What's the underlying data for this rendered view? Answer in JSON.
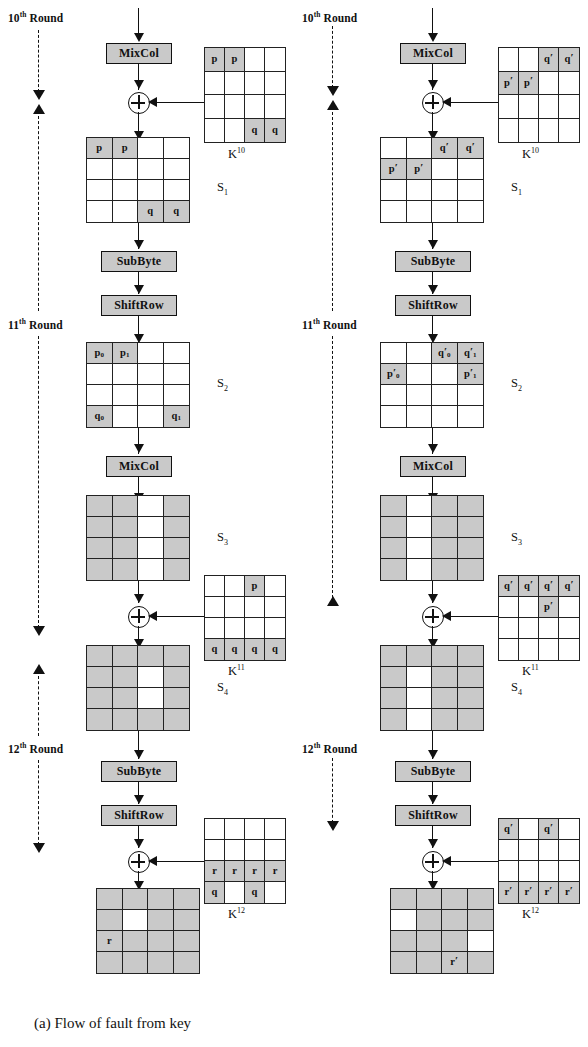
{
  "figure": {
    "caption_a": "(a) Flow of fault from key",
    "caption_b": "(b)  Flow  of  fault  from",
    "shade_color": "#c9c9c9",
    "line_color": "#111111"
  },
  "rounds": {
    "r10": "10",
    "r11": "11",
    "r12": "12",
    "ordinal": "th",
    "word": " Round"
  },
  "ops": {
    "mixcol": "MixCol",
    "subbyte": "SubByte",
    "shiftrow": "ShiftRow"
  },
  "labels": {
    "k10": "K",
    "k10_sup": "10",
    "k11": "K",
    "k11_sup": "11",
    "k12": "K",
    "k12_sup": "12",
    "s1": "S",
    "s1_sub": "1",
    "s2": "S",
    "s2_sub": "2",
    "s3": "S",
    "s3_sub": "3",
    "s4": "S",
    "s4_sub": "4"
  },
  "left": {
    "k10": {
      "name": "K10",
      "cells": [
        {
          "t": "p",
          "sh": true
        },
        {
          "t": "p",
          "sh": true
        },
        {
          "t": "",
          "sh": false
        },
        {
          "t": "",
          "sh": false
        },
        {
          "t": "",
          "sh": false
        },
        {
          "t": "",
          "sh": false
        },
        {
          "t": "",
          "sh": false
        },
        {
          "t": "",
          "sh": false
        },
        {
          "t": "",
          "sh": false
        },
        {
          "t": "",
          "sh": false
        },
        {
          "t": "",
          "sh": false
        },
        {
          "t": "",
          "sh": false
        },
        {
          "t": "",
          "sh": false
        },
        {
          "t": "",
          "sh": false
        },
        {
          "t": "q",
          "sh": true
        },
        {
          "t": "q",
          "sh": true
        }
      ]
    },
    "s1": {
      "name": "S1",
      "cells": [
        {
          "t": "p",
          "sh": true
        },
        {
          "t": "p",
          "sh": true
        },
        {
          "t": "",
          "sh": false
        },
        {
          "t": "",
          "sh": false
        },
        {
          "t": "",
          "sh": false
        },
        {
          "t": "",
          "sh": false
        },
        {
          "t": "",
          "sh": false
        },
        {
          "t": "",
          "sh": false
        },
        {
          "t": "",
          "sh": false
        },
        {
          "t": "",
          "sh": false
        },
        {
          "t": "",
          "sh": false
        },
        {
          "t": "",
          "sh": false
        },
        {
          "t": "",
          "sh": false
        },
        {
          "t": "",
          "sh": false
        },
        {
          "t": "q",
          "sh": true
        },
        {
          "t": "q",
          "sh": true
        }
      ]
    },
    "s2": {
      "name": "S2",
      "cells": [
        {
          "t": "p",
          "sub": "0",
          "sh": true
        },
        {
          "t": "p",
          "sub": "1",
          "sh": true
        },
        {
          "t": "",
          "sh": false
        },
        {
          "t": "",
          "sh": false
        },
        {
          "t": "",
          "sh": false
        },
        {
          "t": "",
          "sh": false
        },
        {
          "t": "",
          "sh": false
        },
        {
          "t": "",
          "sh": false
        },
        {
          "t": "",
          "sh": false
        },
        {
          "t": "",
          "sh": false
        },
        {
          "t": "",
          "sh": false
        },
        {
          "t": "",
          "sh": false
        },
        {
          "t": "q",
          "sub": "0",
          "sh": true
        },
        {
          "t": "",
          "sh": false
        },
        {
          "t": "",
          "sh": false
        },
        {
          "t": "q",
          "sub": "1",
          "sh": true
        }
      ]
    },
    "s3": {
      "name": "S3",
      "cells": [
        {
          "t": "",
          "sh": true
        },
        {
          "t": "",
          "sh": true
        },
        {
          "t": "",
          "sh": false
        },
        {
          "t": "",
          "sh": true
        },
        {
          "t": "",
          "sh": true
        },
        {
          "t": "",
          "sh": true
        },
        {
          "t": "",
          "sh": false
        },
        {
          "t": "",
          "sh": true
        },
        {
          "t": "",
          "sh": true
        },
        {
          "t": "",
          "sh": true
        },
        {
          "t": "",
          "sh": false
        },
        {
          "t": "",
          "sh": true
        },
        {
          "t": "",
          "sh": true
        },
        {
          "t": "",
          "sh": true
        },
        {
          "t": "",
          "sh": false
        },
        {
          "t": "",
          "sh": true
        }
      ]
    },
    "k11": {
      "name": "K11",
      "cells": [
        {
          "t": "",
          "sh": false
        },
        {
          "t": "",
          "sh": false
        },
        {
          "t": "p",
          "sh": true
        },
        {
          "t": "",
          "sh": false
        },
        {
          "t": "",
          "sh": false
        },
        {
          "t": "",
          "sh": false
        },
        {
          "t": "",
          "sh": false
        },
        {
          "t": "",
          "sh": false
        },
        {
          "t": "",
          "sh": false
        },
        {
          "t": "",
          "sh": false
        },
        {
          "t": "",
          "sh": false
        },
        {
          "t": "",
          "sh": false
        },
        {
          "t": "q",
          "sh": true
        },
        {
          "t": "q",
          "sh": true
        },
        {
          "t": "q",
          "sh": true
        },
        {
          "t": "q",
          "sh": true
        }
      ]
    },
    "s4": {
      "name": "S4",
      "cells": [
        {
          "t": "",
          "sh": true
        },
        {
          "t": "",
          "sh": true
        },
        {
          "t": "",
          "sh": true
        },
        {
          "t": "",
          "sh": true
        },
        {
          "t": "",
          "sh": true
        },
        {
          "t": "",
          "sh": true
        },
        {
          "t": "",
          "sh": false
        },
        {
          "t": "",
          "sh": true
        },
        {
          "t": "",
          "sh": true
        },
        {
          "t": "",
          "sh": true
        },
        {
          "t": "",
          "sh": false
        },
        {
          "t": "",
          "sh": true
        },
        {
          "t": "",
          "sh": true
        },
        {
          "t": "",
          "sh": true
        },
        {
          "t": "",
          "sh": true
        },
        {
          "t": "",
          "sh": true
        }
      ]
    },
    "k12": {
      "name": "K12",
      "cells": [
        {
          "t": "",
          "sh": false
        },
        {
          "t": "",
          "sh": false
        },
        {
          "t": "",
          "sh": false
        },
        {
          "t": "",
          "sh": false
        },
        {
          "t": "",
          "sh": false
        },
        {
          "t": "",
          "sh": false
        },
        {
          "t": "",
          "sh": false
        },
        {
          "t": "",
          "sh": false
        },
        {
          "t": "r",
          "sh": true
        },
        {
          "t": "r",
          "sh": true
        },
        {
          "t": "r",
          "sh": true
        },
        {
          "t": "r",
          "sh": true
        },
        {
          "t": "q",
          "sh": true
        },
        {
          "t": "",
          "sh": false
        },
        {
          "t": "q",
          "sh": true
        },
        {
          "t": "",
          "sh": false
        }
      ]
    },
    "final": {
      "name": "final-state",
      "cells": [
        {
          "t": "",
          "sh": true
        },
        {
          "t": "",
          "sh": true
        },
        {
          "t": "",
          "sh": true
        },
        {
          "t": "",
          "sh": true
        },
        {
          "t": "",
          "sh": true
        },
        {
          "t": "",
          "sh": false
        },
        {
          "t": "",
          "sh": true
        },
        {
          "t": "",
          "sh": true
        },
        {
          "t": "r",
          "sh": true
        },
        {
          "t": "",
          "sh": true
        },
        {
          "t": "",
          "sh": true
        },
        {
          "t": "",
          "sh": true
        },
        {
          "t": "",
          "sh": true
        },
        {
          "t": "",
          "sh": true
        },
        {
          "t": "",
          "sh": true
        },
        {
          "t": "",
          "sh": true
        }
      ]
    }
  },
  "right": {
    "k10": {
      "name": "K10",
      "cells": [
        {
          "t": "",
          "sh": false
        },
        {
          "t": "",
          "sh": false
        },
        {
          "t": "q",
          "pr": true,
          "sh": true
        },
        {
          "t": "q",
          "pr": true,
          "sh": true
        },
        {
          "t": "p",
          "pr": true,
          "sh": true
        },
        {
          "t": "p",
          "pr": true,
          "sh": true
        },
        {
          "t": "",
          "sh": false
        },
        {
          "t": "",
          "sh": false
        },
        {
          "t": "",
          "sh": false
        },
        {
          "t": "",
          "sh": false
        },
        {
          "t": "",
          "sh": false
        },
        {
          "t": "",
          "sh": false
        },
        {
          "t": "",
          "sh": false
        },
        {
          "t": "",
          "sh": false
        },
        {
          "t": "",
          "sh": false
        },
        {
          "t": "",
          "sh": false
        }
      ]
    },
    "s1": {
      "name": "S1",
      "cells": [
        {
          "t": "",
          "sh": false
        },
        {
          "t": "",
          "sh": false
        },
        {
          "t": "q",
          "pr": true,
          "sh": true
        },
        {
          "t": "q",
          "pr": true,
          "sh": true
        },
        {
          "t": "p",
          "pr": true,
          "sh": true
        },
        {
          "t": "p",
          "pr": true,
          "sh": true
        },
        {
          "t": "",
          "sh": false
        },
        {
          "t": "",
          "sh": false
        },
        {
          "t": "",
          "sh": false
        },
        {
          "t": "",
          "sh": false
        },
        {
          "t": "",
          "sh": false
        },
        {
          "t": "",
          "sh": false
        },
        {
          "t": "",
          "sh": false
        },
        {
          "t": "",
          "sh": false
        },
        {
          "t": "",
          "sh": false
        },
        {
          "t": "",
          "sh": false
        }
      ]
    },
    "s2": {
      "name": "S2",
      "cells": [
        {
          "t": "",
          "sh": false
        },
        {
          "t": "",
          "sh": false
        },
        {
          "t": "q",
          "pr": true,
          "sub": "0",
          "sh": true
        },
        {
          "t": "q",
          "pr": true,
          "sub": "1",
          "sh": true
        },
        {
          "t": "p",
          "pr": true,
          "sub": "0",
          "sh": true
        },
        {
          "t": "",
          "sh": false
        },
        {
          "t": "",
          "sh": false
        },
        {
          "t": "p",
          "pr": true,
          "sub": "1",
          "sh": true
        },
        {
          "t": "",
          "sh": false
        },
        {
          "t": "",
          "sh": false
        },
        {
          "t": "",
          "sh": false
        },
        {
          "t": "",
          "sh": false
        },
        {
          "t": "",
          "sh": false
        },
        {
          "t": "",
          "sh": false
        },
        {
          "t": "",
          "sh": false
        },
        {
          "t": "",
          "sh": false
        }
      ]
    },
    "s3": {
      "name": "S3",
      "cells": [
        {
          "t": "",
          "sh": true
        },
        {
          "t": "",
          "sh": false
        },
        {
          "t": "",
          "sh": true
        },
        {
          "t": "",
          "sh": true
        },
        {
          "t": "",
          "sh": true
        },
        {
          "t": "",
          "sh": false
        },
        {
          "t": "",
          "sh": true
        },
        {
          "t": "",
          "sh": true
        },
        {
          "t": "",
          "sh": true
        },
        {
          "t": "",
          "sh": false
        },
        {
          "t": "",
          "sh": true
        },
        {
          "t": "",
          "sh": true
        },
        {
          "t": "",
          "sh": true
        },
        {
          "t": "",
          "sh": false
        },
        {
          "t": "",
          "sh": true
        },
        {
          "t": "",
          "sh": true
        }
      ]
    },
    "k11": {
      "name": "K11",
      "cells": [
        {
          "t": "q",
          "pr": true,
          "sh": true
        },
        {
          "t": "q",
          "pr": true,
          "sh": true
        },
        {
          "t": "q",
          "pr": true,
          "sh": true
        },
        {
          "t": "q",
          "pr": true,
          "sh": true
        },
        {
          "t": "",
          "sh": false
        },
        {
          "t": "",
          "sh": false
        },
        {
          "t": "p",
          "pr": true,
          "sh": true
        },
        {
          "t": "",
          "sh": false
        },
        {
          "t": "",
          "sh": false
        },
        {
          "t": "",
          "sh": false
        },
        {
          "t": "",
          "sh": false
        },
        {
          "t": "",
          "sh": false
        },
        {
          "t": "",
          "sh": false
        },
        {
          "t": "",
          "sh": false
        },
        {
          "t": "",
          "sh": false
        },
        {
          "t": "",
          "sh": false
        }
      ]
    },
    "s4": {
      "name": "S4",
      "cells": [
        {
          "t": "",
          "sh": true
        },
        {
          "t": "",
          "sh": true
        },
        {
          "t": "",
          "sh": true
        },
        {
          "t": "",
          "sh": true
        },
        {
          "t": "",
          "sh": true
        },
        {
          "t": "",
          "sh": false
        },
        {
          "t": "",
          "sh": true
        },
        {
          "t": "",
          "sh": true
        },
        {
          "t": "",
          "sh": true
        },
        {
          "t": "",
          "sh": false
        },
        {
          "t": "",
          "sh": true
        },
        {
          "t": "",
          "sh": true
        },
        {
          "t": "",
          "sh": true
        },
        {
          "t": "",
          "sh": false
        },
        {
          "t": "",
          "sh": true
        },
        {
          "t": "",
          "sh": true
        }
      ]
    },
    "k12": {
      "name": "K12",
      "cells": [
        {
          "t": "q",
          "pr": true,
          "sh": true
        },
        {
          "t": "",
          "sh": false
        },
        {
          "t": "q",
          "pr": true,
          "sh": true
        },
        {
          "t": "",
          "sh": false
        },
        {
          "t": "",
          "sh": false
        },
        {
          "t": "",
          "sh": false
        },
        {
          "t": "",
          "sh": false
        },
        {
          "t": "",
          "sh": false
        },
        {
          "t": "",
          "sh": false
        },
        {
          "t": "",
          "sh": false
        },
        {
          "t": "",
          "sh": false
        },
        {
          "t": "",
          "sh": false
        },
        {
          "t": "r",
          "pr": true,
          "sh": true
        },
        {
          "t": "r",
          "pr": true,
          "sh": true
        },
        {
          "t": "r",
          "pr": true,
          "sh": true
        },
        {
          "t": "r",
          "pr": true,
          "sh": true
        }
      ]
    },
    "final": {
      "name": "final-state",
      "cells": [
        {
          "t": "",
          "sh": true
        },
        {
          "t": "",
          "sh": true
        },
        {
          "t": "",
          "sh": true
        },
        {
          "t": "",
          "sh": true
        },
        {
          "t": "",
          "sh": false
        },
        {
          "t": "",
          "sh": true
        },
        {
          "t": "",
          "sh": true
        },
        {
          "t": "",
          "sh": true
        },
        {
          "t": "",
          "sh": true
        },
        {
          "t": "",
          "sh": true
        },
        {
          "t": "",
          "sh": true
        },
        {
          "t": "",
          "sh": false
        },
        {
          "t": "",
          "sh": true
        },
        {
          "t": "",
          "sh": true
        },
        {
          "t": "r",
          "pr": true,
          "sh": true
        },
        {
          "t": "",
          "sh": true
        }
      ]
    }
  }
}
